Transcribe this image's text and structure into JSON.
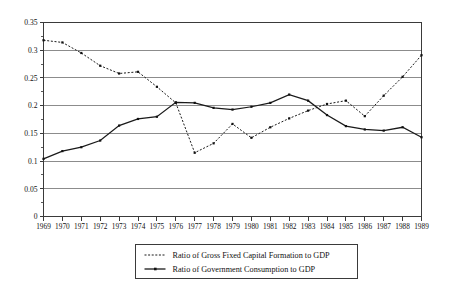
{
  "chart_data": {
    "type": "line",
    "title": "",
    "subtitle": "",
    "xlabel": "",
    "ylabel": "",
    "grid": true,
    "legend_position": "bottom",
    "xlim": [
      1969,
      1989
    ],
    "ylim": [
      0,
      0.35
    ],
    "y_ticks": [
      "0",
      "0.05",
      "0.1",
      "0.15",
      "0.2",
      "0.25",
      "0.3",
      "0.35"
    ],
    "y_tick_values": [
      0,
      0.05,
      0.1,
      0.15,
      0.2,
      0.25,
      0.3,
      0.35
    ],
    "categories": [
      "1969",
      "1970",
      "1971",
      "1972",
      "1973",
      "1974",
      "1975",
      "1976",
      "1977",
      "1978",
      "1979",
      "1980",
      "1981",
      "1982",
      "1983",
      "1984",
      "1985",
      "1986",
      "1987",
      "1988",
      "1989"
    ],
    "x": [
      1969,
      1970,
      1971,
      1972,
      1973,
      1974,
      1975,
      1976,
      1977,
      1978,
      1979,
      1980,
      1981,
      1982,
      1983,
      1984,
      1985,
      1986,
      1987,
      1988,
      1989
    ],
    "series": [
      {
        "name": "Ratio of Gross Fixed Capital Formation to GDP",
        "style": "dotted",
        "marker": "dot",
        "values": [
          0.318,
          0.314,
          0.295,
          0.272,
          0.258,
          0.261,
          0.234,
          0.205,
          0.115,
          0.132,
          0.167,
          0.142,
          0.161,
          0.177,
          0.191,
          0.203,
          0.209,
          0.181,
          0.218,
          0.252,
          0.291
        ]
      },
      {
        "name": "Ratio of Government Consumption to GDP",
        "style": "solid",
        "marker": "dot",
        "values": [
          0.104,
          0.118,
          0.125,
          0.137,
          0.164,
          0.176,
          0.18,
          0.206,
          0.205,
          0.196,
          0.193,
          0.198,
          0.205,
          0.22,
          0.209,
          0.183,
          0.163,
          0.157,
          0.155,
          0.161,
          0.143
        ]
      }
    ]
  },
  "legend": {
    "entries": [
      {
        "label": "Ratio of Gross Fixed Capital Formation to GDP"
      },
      {
        "label": "Ratio of Government Consumption to GDP"
      }
    ]
  }
}
